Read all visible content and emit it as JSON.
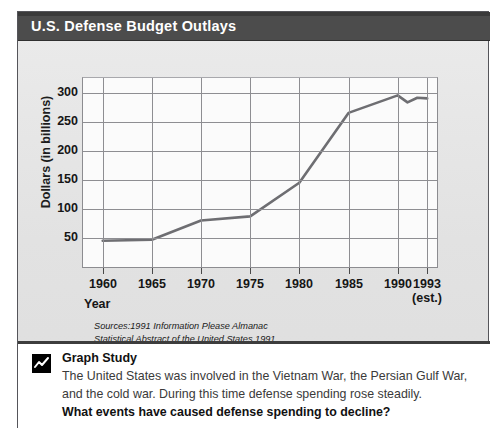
{
  "title": "U.S. Defense Budget Outlays",
  "axis": {
    "y_title": "Dollars (in billions)",
    "x_title": "Year"
  },
  "sources": {
    "line1": "Sources:1991 Information Please Almanac",
    "line2": "Statistical Abstract of the United States 1991"
  },
  "caption": {
    "icon": "line-chart-icon",
    "heading": "Graph Study",
    "body": "The United States was involved in the Vietnam War, the Persian Gulf War, and the cold war. During this time defense spending rose steadily.",
    "question": "What events have caused defense spending to decline?"
  },
  "colors": {
    "titlebar": "#4c4c4c",
    "line": "#6e6e72",
    "grid": "#8e8e92",
    "plot_bg": "#fbfbfb",
    "card_bg": "#e4e4e4"
  },
  "chart_data": {
    "type": "line",
    "title": "U.S. Defense Budget Outlays",
    "xlabel": "Year",
    "ylabel": "Dollars (in billions)",
    "xlim": [
      1958,
      1994
    ],
    "ylim": [
      0,
      325
    ],
    "grid": true,
    "legend": null,
    "ytick_values": [
      50,
      100,
      150,
      200,
      250,
      300
    ],
    "ytick_labels": [
      "50",
      "100",
      "150",
      "200",
      "250",
      "300"
    ],
    "xtick_values": [
      1960,
      1965,
      1970,
      1975,
      1980,
      1985,
      1990,
      1993
    ],
    "xtick_labels": [
      "1960",
      "1965",
      "1970",
      "1975",
      "1980",
      "1985",
      "1990",
      "1993"
    ],
    "xtick_sublabels": [
      "",
      "",
      "",
      "",
      "",
      "",
      "",
      "(est.)"
    ],
    "x": [
      1960,
      1965,
      1970,
      1975,
      1980,
      1985,
      1990,
      1991,
      1992,
      1993
    ],
    "values": [
      45,
      47,
      80,
      87,
      145,
      265,
      295,
      283,
      291,
      290
    ],
    "series": [
      {
        "name": "Defense outlays",
        "x": [
          1960,
          1965,
          1970,
          1975,
          1980,
          1985,
          1990,
          1991,
          1992,
          1993
        ],
        "values": [
          45,
          47,
          80,
          87,
          145,
          265,
          295,
          283,
          291,
          290
        ]
      }
    ]
  }
}
